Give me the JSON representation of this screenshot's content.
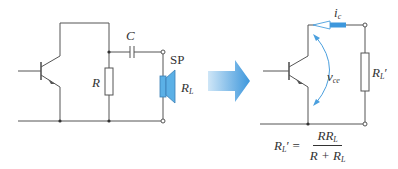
{
  "left_circuit": {
    "capacitor_label": "C",
    "resistor_label": "R",
    "speaker_label": "SP",
    "load_label": "R",
    "load_sub": "L"
  },
  "arrow": {
    "icon": "right-arrow-icon",
    "color": "#4a9fde"
  },
  "right_circuit": {
    "current_label": "i",
    "current_sub": "c",
    "voltage_label": "v",
    "voltage_sub": "ce",
    "load_label": "R",
    "load_sub": "L",
    "load_prime": "′"
  },
  "formula": {
    "lhs": "R",
    "lhs_sub": "L",
    "lhs_prime": "′ =",
    "numerator": "RR",
    "numerator_sub": "L",
    "denominator": "R + R",
    "denominator_sub": "L"
  },
  "colors": {
    "wire": "#555555",
    "accent": "#4a9fde",
    "speaker": "#5bb0e6"
  }
}
